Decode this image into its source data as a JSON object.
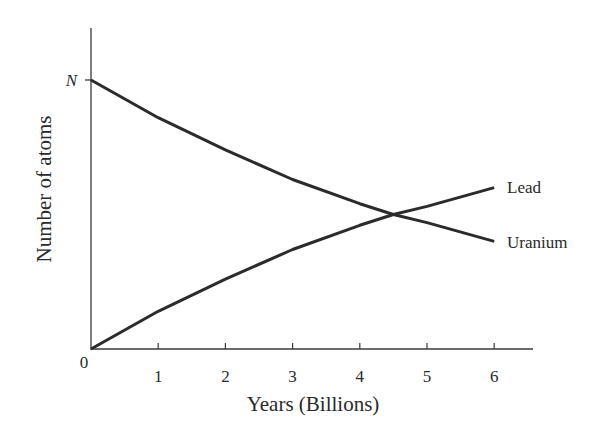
{
  "chart_data": {
    "type": "line",
    "title": "",
    "xlabel": "Years (Billions)",
    "ylabel": "Number of atoms",
    "x": [
      0,
      1,
      2,
      3,
      4,
      4.5,
      5,
      6
    ],
    "xticks": [
      "1",
      "2",
      "3",
      "4",
      "5",
      "6"
    ],
    "origin_label": "0",
    "yticks": [
      "N"
    ],
    "ylim": [
      0,
      1
    ],
    "xlim": [
      0,
      6.6
    ],
    "series": [
      {
        "name": "Uranium",
        "values": [
          1.0,
          0.86,
          0.74,
          0.63,
          0.54,
          0.5,
          0.47,
          0.4
        ]
      },
      {
        "name": "Lead",
        "values": [
          0.0,
          0.14,
          0.26,
          0.37,
          0.46,
          0.5,
          0.53,
          0.6
        ]
      }
    ],
    "grid": false,
    "legend": "inline labels at line ends",
    "colors": {
      "line": "#2b2b2b",
      "axis": "#3a3a3a"
    }
  }
}
